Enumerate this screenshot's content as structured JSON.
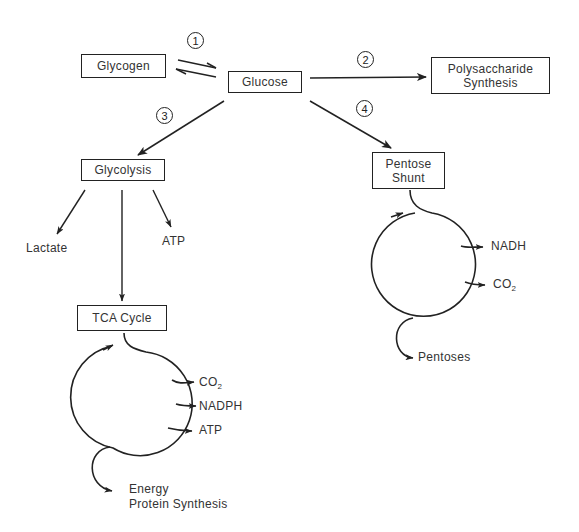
{
  "nodes": {
    "glycogen": "Glycogen",
    "glucose": "Glucose",
    "polysaccharide_line1": "Polysaccharide",
    "polysaccharide_line2": "Synthesis",
    "glycolysis": "Glycolysis",
    "pentose_line1": "Pentose",
    "pentose_line2": "Shunt",
    "tca": "TCA Cycle"
  },
  "steps": [
    "1",
    "2",
    "3",
    "4"
  ],
  "glycolysis_products": {
    "lactate": "Lactate",
    "atp": "ATP"
  },
  "tca_products": {
    "co2_base": "CO",
    "co2_sub": "2",
    "nadph": "NADPH",
    "atp": "ATP",
    "energy_line1": "Energy",
    "energy_line2": "Protein Synthesis"
  },
  "pentose_products": {
    "nadh": "NADH",
    "co2_base": "CO",
    "co2_sub": "2",
    "pentoses": "Pentoses"
  },
  "colors": {
    "stroke": "#222222",
    "text": "#333333",
    "background": "#ffffff"
  }
}
